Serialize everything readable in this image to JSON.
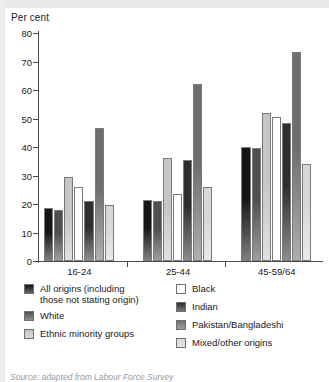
{
  "chart_data": {
    "type": "bar",
    "title": "",
    "ylabel": "Per cent",
    "xlabel": "",
    "ylim": [
      0,
      80
    ],
    "yticks": [
      0,
      10,
      20,
      30,
      40,
      50,
      60,
      70,
      80
    ],
    "grid": false,
    "legend_position": "below",
    "categories": [
      "16-24",
      "25-44",
      "45-59/64"
    ],
    "series": [
      {
        "name": "All origins (including those not stating origin)",
        "color": "#151515",
        "values": [
          18.5,
          21.5,
          40.0
        ]
      },
      {
        "name": "White",
        "color": "#4f4f4f",
        "values": [
          18.0,
          21.0,
          39.5
        ]
      },
      {
        "name": "Ethnic minority groups",
        "color": "#c6c6c6",
        "values": [
          29.5,
          36.0,
          52.0
        ]
      },
      {
        "name": "Black",
        "color": "#ffffff",
        "values": [
          26.0,
          23.5,
          50.5
        ]
      },
      {
        "name": "Indian",
        "color": "#2e2e2e",
        "values": [
          21.0,
          35.5,
          48.5
        ]
      },
      {
        "name": "Pakistan/Bangladeshi",
        "color": "#6e6e6e",
        "values": [
          46.5,
          62.0,
          73.5
        ]
      },
      {
        "name": "Mixed/other origins",
        "color": "#d8d8d8",
        "values": [
          19.5,
          26.0,
          34.0
        ]
      }
    ]
  },
  "axis": {
    "y_label": "Per cent",
    "tick_labels": [
      "80",
      "70",
      "60",
      "50",
      "40",
      "30",
      "20",
      "10",
      "0"
    ],
    "group_labels": [
      "16-24",
      "25-44",
      "45-59/64"
    ]
  },
  "legend": {
    "left_items": [
      {
        "label": "All origins (including\nthose not stating origin)",
        "color": "#151515"
      },
      {
        "label": "White",
        "color": "#4f4f4f"
      },
      {
        "label": "Ethnic minority groups",
        "color": "#c6c6c6"
      }
    ],
    "right_items": [
      {
        "label": "Black",
        "color": "#ffffff"
      },
      {
        "label": "Indian",
        "color": "#2e2e2e"
      },
      {
        "label": "Pakistan/Bangladeshi",
        "color": "#6e6e6e"
      },
      {
        "label": "Mixed/other origins",
        "color": "#d8d8d8"
      }
    ]
  },
  "footer": {
    "source": "Source:  adapted from Labour Force Survey"
  }
}
